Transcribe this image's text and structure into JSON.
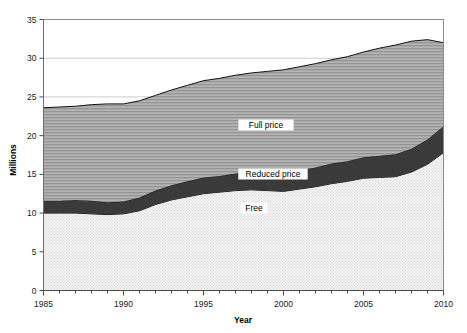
{
  "chart_data": {
    "type": "area",
    "stacked": true,
    "title": "",
    "subtitle": "",
    "xlabel": "Year",
    "ylabel": "Millions",
    "xlim": [
      1985,
      2010
    ],
    "ylim": [
      0,
      35
    ],
    "yticks": [
      0,
      5,
      10,
      15,
      20,
      25,
      30,
      35
    ],
    "ytick_labels": [
      "0",
      "5",
      "10",
      "15",
      "20",
      "25",
      "30",
      "35"
    ],
    "xticks": [
      1985,
      1990,
      1995,
      2000,
      2005,
      2010
    ],
    "xtick_labels": [
      "1985",
      "1990",
      "1995",
      "2000",
      "2005",
      "2010"
    ],
    "x_minor_tick_interval": 1,
    "grid": "horizontal",
    "legend_position": "inline-labels",
    "x": [
      1985,
      1986,
      1987,
      1988,
      1989,
      1990,
      1991,
      1992,
      1993,
      1994,
      1995,
      1996,
      1997,
      1998,
      1999,
      2000,
      2001,
      2002,
      2003,
      2004,
      2005,
      2006,
      2007,
      2008,
      2009,
      2010
    ],
    "series": [
      {
        "name": "Free",
        "fill": "#ececec",
        "pattern": "dotted",
        "label": "Free",
        "values": [
          10.0,
          10.0,
          10.0,
          9.9,
          9.8,
          9.9,
          10.3,
          11.1,
          11.7,
          12.1,
          12.5,
          12.7,
          12.9,
          13.0,
          12.9,
          12.8,
          13.1,
          13.4,
          13.8,
          14.1,
          14.5,
          14.6,
          14.7,
          15.3,
          16.3,
          17.8
        ]
      },
      {
        "name": "Reduced price",
        "fill": "#3a3a3a",
        "pattern": "solid",
        "label": "Reduced price",
        "values": [
          1.6,
          1.6,
          1.7,
          1.7,
          1.6,
          1.6,
          1.7,
          1.8,
          1.9,
          2.0,
          2.1,
          2.1,
          2.2,
          2.3,
          2.3,
          2.3,
          2.4,
          2.5,
          2.6,
          2.6,
          2.7,
          2.8,
          2.9,
          3.0,
          3.2,
          3.4
        ]
      },
      {
        "name": "Full price",
        "fill": "#a8a8a8",
        "pattern": "horizontal-lines",
        "label": "Full price",
        "values": [
          12.0,
          12.1,
          12.1,
          12.4,
          12.7,
          12.6,
          12.5,
          12.3,
          12.3,
          12.4,
          12.5,
          12.6,
          12.7,
          12.8,
          13.1,
          13.4,
          13.4,
          13.4,
          13.4,
          13.5,
          13.6,
          13.9,
          14.1,
          13.9,
          12.9,
          10.8
        ]
      }
    ],
    "totals": [
      23.6,
      23.7,
      23.8,
      24.0,
      24.1,
      24.1,
      24.5,
      25.2,
      25.9,
      26.5,
      27.1,
      27.4,
      27.8,
      28.1,
      28.3,
      28.5,
      28.9,
      29.3,
      29.8,
      30.2,
      30.8,
      31.3,
      31.7,
      32.2,
      32.4,
      32.0
    ]
  },
  "axis": {
    "y_title": "Millions",
    "x_title": "Year"
  },
  "labels": {
    "full_price": "Full price",
    "reduced_price": "Reduced price",
    "free": "Free"
  },
  "colors": {
    "full_price": "#a8a8a8",
    "reduced_price": "#3a3a3a",
    "free": "#ececec",
    "axis": "#808080",
    "gridline": "#bfbfbf",
    "outline": "#000000",
    "background": "#ffffff"
  }
}
